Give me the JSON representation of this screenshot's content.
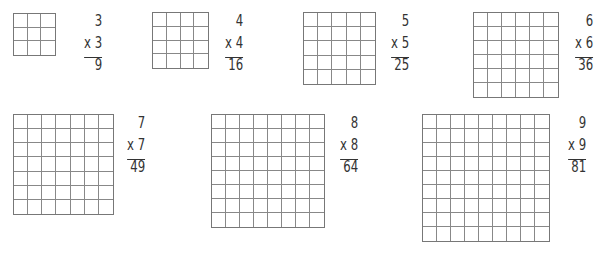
{
  "problems": [
    {
      "n": 3,
      "factor_top": "3",
      "factor_bottom": "x 3",
      "product": "9",
      "grid": {
        "x": 13,
        "y": 13,
        "size": 43
      },
      "text": {
        "right": 102,
        "top": 14
      }
    },
    {
      "n": 4,
      "factor_top": "4",
      "factor_bottom": "x 4",
      "product": "16",
      "grid": {
        "x": 152,
        "y": 12,
        "size": 57
      },
      "text": {
        "right": 243,
        "top": 14
      }
    },
    {
      "n": 5,
      "factor_top": "5",
      "factor_bottom": "x 5",
      "product": "25",
      "grid": {
        "x": 303,
        "y": 12,
        "size": 73
      },
      "text": {
        "right": 409,
        "top": 14
      }
    },
    {
      "n": 6,
      "factor_top": "6",
      "factor_bottom": "x 6",
      "product": "36",
      "grid": {
        "x": 473,
        "y": 12,
        "size": 86
      },
      "text": {
        "right": 593,
        "top": 14
      }
    },
    {
      "n": 7,
      "factor_top": "7",
      "factor_bottom": "x 7",
      "product": "49",
      "grid": {
        "x": 13,
        "y": 114,
        "size": 101
      },
      "text": {
        "right": 145,
        "top": 116
      }
    },
    {
      "n": 8,
      "factor_top": "8",
      "factor_bottom": "x 8",
      "product": "64",
      "grid": {
        "x": 211,
        "y": 114,
        "size": 114
      },
      "text": {
        "right": 358,
        "top": 116
      }
    },
    {
      "n": 9,
      "factor_top": "9",
      "factor_bottom": "x 9",
      "product": "81",
      "grid": {
        "x": 422,
        "y": 114,
        "size": 128
      },
      "text": {
        "right": 586,
        "top": 116
      }
    }
  ],
  "colors": {
    "grid_line": "#888888",
    "text": "#333333",
    "background": "#ffffff"
  }
}
